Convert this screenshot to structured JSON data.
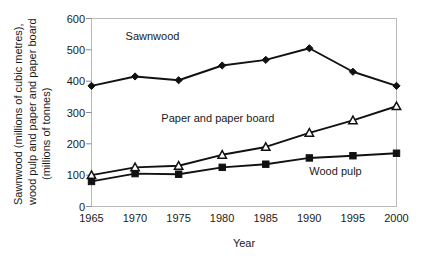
{
  "chart_data": {
    "type": "line",
    "title": "",
    "xlabel": "Year",
    "ylabel": "Sawnwood (millions of cubic metres), wood pulp and paper and paper board (millions of tonnes)",
    "ylabel_lines": [
      "Sawnwood (millions of cubic metres),",
      "wood pulp and paper and paper board",
      "(millions of tonnes)"
    ],
    "x": [
      1965,
      1970,
      1975,
      1980,
      1985,
      1990,
      1995,
      2000
    ],
    "xtick_labels": [
      "1965",
      "1970",
      "1975",
      "1980",
      "1985",
      "1990",
      "1995",
      "2000"
    ],
    "ytick_labels": [
      "0",
      "100",
      "200",
      "300",
      "400",
      "500",
      "600"
    ],
    "yticks": [
      0,
      100,
      200,
      300,
      400,
      500,
      600
    ],
    "xlim": [
      1965,
      2000
    ],
    "ylim": [
      0,
      600
    ],
    "grid": false,
    "legend_position": "inline-annotations",
    "series": [
      {
        "name": "Sawnwood",
        "marker": "filled-diamond",
        "color": "#111111",
        "values": [
          385,
          415,
          403,
          450,
          468,
          505,
          430,
          385
        ],
        "label_x": 1972,
        "label_y": 530
      },
      {
        "name": "Paper and paper board",
        "marker": "open-triangle",
        "color": "#111111",
        "values": [
          100,
          125,
          130,
          165,
          190,
          235,
          275,
          320
        ],
        "label_x": 1979.5,
        "label_y": 270
      },
      {
        "name": "Wood pulp",
        "marker": "filled-square",
        "color": "#111111",
        "values": [
          80,
          105,
          103,
          125,
          135,
          155,
          162,
          170
        ],
        "label_x": 1993,
        "label_y": 100
      }
    ]
  }
}
